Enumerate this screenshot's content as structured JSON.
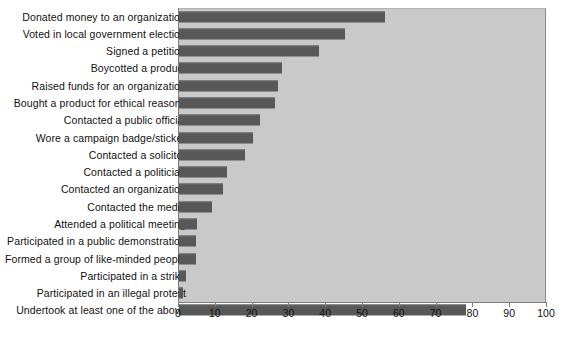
{
  "chart_data": {
    "type": "bar",
    "orientation": "horizontal",
    "title": "",
    "xlabel": "",
    "ylabel": "",
    "xlim": [
      0,
      100
    ],
    "xticks": [
      0,
      10,
      20,
      30,
      40,
      50,
      60,
      70,
      80,
      90,
      100
    ],
    "xtick_labels": [
      "0",
      "10",
      "20",
      "30",
      "40",
      "50",
      "60",
      "70",
      "80",
      "90",
      "100"
    ],
    "grid": false,
    "legend": null,
    "categories": [
      "Donated money to an organization",
      "Voted in local government election",
      "Signed a petition",
      "Boycotted a product",
      "Raised funds for an organization",
      "Bought a product for ethical reasons",
      "Contacted a public official",
      "Wore a campaign badge/sticker",
      "Contacted a solicitor",
      "Contacted a politician",
      "Contacted an organization",
      "Contacted the media",
      "Attended a political meeting",
      "Participated in a public demonstration",
      "Formed a group of like-minded people",
      "Participated in a strike",
      "Participated in an illegal protest",
      "Undertook at least one of the above"
    ],
    "values": [
      56,
      45,
      38,
      28,
      27,
      26,
      22,
      20,
      18,
      13,
      12,
      9,
      5,
      4.5,
      4.5,
      2,
      1,
      78
    ],
    "bar_color": "#585858",
    "plot_background": "#c9c9c9",
    "page_background": "#ffffff"
  },
  "footer": {
    "note": ""
  }
}
